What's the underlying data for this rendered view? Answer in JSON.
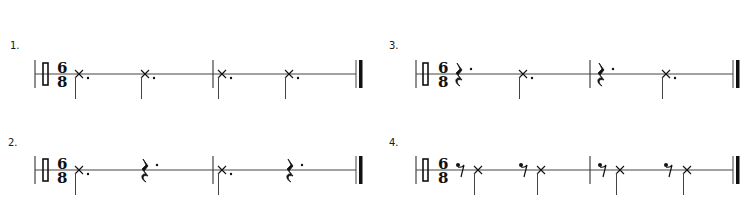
{
  "colors": {
    "ink": "#111111",
    "staff": "#444444",
    "background": "#ffffff"
  },
  "time_signature": {
    "top": "6",
    "bottom": "8"
  },
  "clef": "percussion-clef",
  "exercises": [
    {
      "label": "1.",
      "label_pos": [
        10,
        41
      ],
      "staff_y": 74,
      "start_x": 35,
      "end_x": 356,
      "clef_x": 43,
      "ts_x": 57,
      "barlines": [
        213
      ],
      "events": [
        {
          "type": "x-note",
          "dotted": true,
          "x": 79
        },
        {
          "type": "x-note",
          "dotted": true,
          "x": 145
        },
        {
          "type": "x-note",
          "dotted": true,
          "x": 222
        },
        {
          "type": "x-note",
          "dotted": true,
          "x": 289
        }
      ]
    },
    {
      "label": "2.",
      "label_pos": [
        8,
        138
      ],
      "staff_y": 170,
      "start_x": 35,
      "end_x": 356,
      "clef_x": 43,
      "ts_x": 57,
      "barlines": [
        213
      ],
      "events": [
        {
          "type": "x-note",
          "dotted": true,
          "x": 79
        },
        {
          "type": "quarter-rest",
          "dotted": true,
          "x": 145
        },
        {
          "type": "x-note",
          "dotted": true,
          "x": 222
        },
        {
          "type": "quarter-rest",
          "dotted": true,
          "x": 290
        }
      ]
    },
    {
      "label": "3.",
      "label_pos": [
        389,
        41
      ],
      "staff_y": 74,
      "start_x": 416,
      "end_x": 733,
      "clef_x": 423,
      "ts_x": 438,
      "barlines": [
        590
      ],
      "events": [
        {
          "type": "quarter-rest",
          "dotted": true,
          "x": 459
        },
        {
          "type": "x-note",
          "dotted": true,
          "x": 523
        },
        {
          "type": "quarter-rest",
          "dotted": true,
          "x": 601
        },
        {
          "type": "x-note",
          "dotted": true,
          "x": 666
        }
      ]
    },
    {
      "label": "4.",
      "label_pos": [
        389,
        138
      ],
      "staff_y": 170,
      "start_x": 416,
      "end_x": 733,
      "clef_x": 423,
      "ts_x": 438,
      "barlines": [
        590
      ],
      "events": [
        {
          "type": "dotted-eighth-rest",
          "x": 461
        },
        {
          "type": "x-note",
          "dotted": false,
          "x": 478
        },
        {
          "type": "dotted-eighth-rest",
          "x": 524
        },
        {
          "type": "x-note",
          "dotted": false,
          "x": 541
        },
        {
          "type": "dotted-eighth-rest",
          "x": 603
        },
        {
          "type": "x-note",
          "dotted": false,
          "x": 620
        },
        {
          "type": "dotted-eighth-rest",
          "x": 669
        },
        {
          "type": "x-note",
          "dotted": false,
          "x": 687
        }
      ]
    }
  ]
}
